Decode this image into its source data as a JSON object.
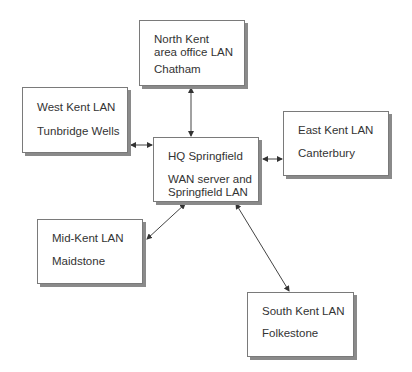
{
  "diagram": {
    "nodes": {
      "north": {
        "title": "North Kent\narea office LAN",
        "location": "Chatham"
      },
      "west": {
        "title": "West Kent LAN",
        "location": "Tunbridge Wells"
      },
      "hq": {
        "title": "HQ Springfield",
        "location": "WAN server and\nSpringfield LAN"
      },
      "east": {
        "title": "East Kent LAN",
        "location": "Canterbury"
      },
      "mid": {
        "title": "Mid-Kent LAN",
        "location": "Maidstone"
      },
      "south": {
        "title": "South Kent LAN",
        "location": "Folkestone"
      }
    },
    "edges": [
      {
        "from": "hq",
        "to": "north",
        "type": "bidirectional"
      },
      {
        "from": "hq",
        "to": "west",
        "type": "bidirectional"
      },
      {
        "from": "hq",
        "to": "east",
        "type": "bidirectional"
      },
      {
        "from": "hq",
        "to": "mid",
        "type": "bidirectional"
      },
      {
        "from": "hq",
        "to": "south",
        "type": "bidirectional"
      }
    ]
  }
}
